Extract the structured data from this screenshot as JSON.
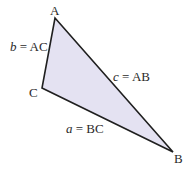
{
  "diagram": {
    "type": "triangle",
    "fill_color": "#e4e2f2",
    "stroke_color": "#1f1f1f",
    "vertices": {
      "A": {
        "label": "A",
        "x": 55,
        "y": 18
      },
      "B": {
        "label": "B",
        "x": 173,
        "y": 152
      },
      "C": {
        "label": "C",
        "x": 42,
        "y": 88
      }
    },
    "sides": {
      "b": {
        "var": "b",
        "eq": " = AC"
      },
      "c": {
        "var": "c",
        "eq": " = AB"
      },
      "a": {
        "var": "a",
        "eq": " = BC"
      }
    }
  }
}
